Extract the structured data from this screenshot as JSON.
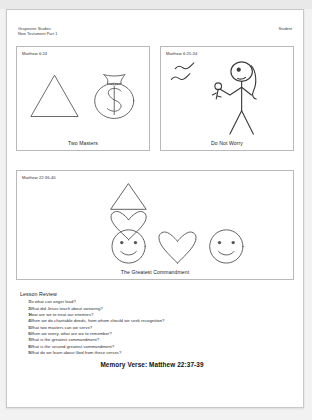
{
  "header": {
    "publisher_line_1": "Grapevine Studies",
    "publisher_line_2": "New Testament Part 1",
    "edition_label": "Student"
  },
  "panels": [
    {
      "id": "two-masters",
      "reference": "Matthew 6:24",
      "caption": "Two Masters",
      "figures": [
        "triangle",
        "money-bag-dollar-sign"
      ]
    },
    {
      "id": "do-not-worry",
      "reference": "Matthew 6:25-34",
      "caption": "Do Not Worry",
      "figures": [
        "two-birds",
        "stick-figure-holding-flower"
      ]
    },
    {
      "id": "greatest-commandment",
      "reference": "Matthew 22:36-40",
      "caption": "The Greatest Commandment",
      "figures": [
        "triangle",
        "heart",
        "smiley-face",
        "heart",
        "smiley-face"
      ]
    }
  ],
  "review": {
    "title": "Lesson Review",
    "questions": [
      "To what can anger lead?",
      "What did Jesus teach about swearing?",
      "How are we to treat our enemies?",
      "When we do charitable deeds, from whom should we seek recognition?",
      "What two masters can we serve?",
      "When we worry, what are we to remember?",
      "What is the greatest commandment?",
      "What is the second greatest commandment?",
      "What do we learn about God from these verses?"
    ],
    "numbers": [
      "1.",
      "2.",
      "3.",
      "4.",
      "5.",
      "6.",
      "7.",
      "8.",
      "9."
    ]
  },
  "memory_verse": "Memory Verse: Matthew 22:37-39",
  "colors": {
    "page_background": "#ffffff",
    "app_background": "#f2f2f2",
    "ink": "#2d2d2d",
    "panel_border": "#b9b9b9",
    "line_art": "#555555"
  }
}
